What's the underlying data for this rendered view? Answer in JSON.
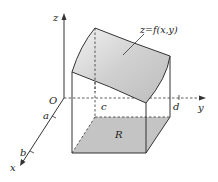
{
  "diagram": {
    "type": "double-integral-volume",
    "labels": {
      "z_axis": "z",
      "y_axis": "y",
      "x_axis": "x",
      "origin": "O",
      "a": "a",
      "b": "b",
      "c": "c",
      "d": "d",
      "region": "R",
      "surface": "z=f(x,y)"
    },
    "colors": {
      "surface_fill": "#d6d6d6",
      "region_fill": "#c4c4c4",
      "line": "#333333",
      "background": "#ffffff"
    }
  }
}
